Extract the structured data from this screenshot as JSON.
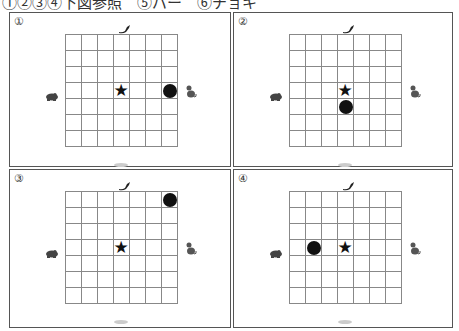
{
  "header": {
    "text": "①②③④下図参照　⑤パー　⑥チョキ"
  },
  "grid": {
    "rows": 7,
    "cols": 7
  },
  "animals": {
    "top": "bird-icon",
    "left": "frog-icon",
    "right": "mouse-icon",
    "bottom": "faint-animal-icon"
  },
  "panels": [
    {
      "label": "①",
      "star": {
        "row": 3,
        "col": 3
      },
      "circle": {
        "row": 3,
        "col": 6
      }
    },
    {
      "label": "②",
      "star": {
        "row": 3,
        "col": 3
      },
      "circle": {
        "row": 4,
        "col": 3
      }
    },
    {
      "label": "③",
      "star": {
        "row": 3,
        "col": 3
      },
      "circle": {
        "row": 0,
        "col": 6
      }
    },
    {
      "label": "④",
      "star": {
        "row": 3,
        "col": 3
      },
      "circle": {
        "row": 3,
        "col": 1
      }
    }
  ],
  "symbols": {
    "star": "★"
  }
}
